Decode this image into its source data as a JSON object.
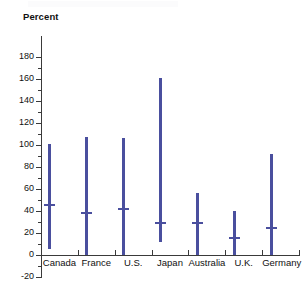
{
  "chart_data": {
    "type": "bar",
    "subtype": "range-with-median",
    "title": "",
    "xlabel": "",
    "ylabel": "Percent",
    "ylim": [
      -20,
      180
    ],
    "y_major_step": 20,
    "y_minor_step": 10,
    "grid": false,
    "legend": "none",
    "y_tick_labels": [
      "180",
      "160",
      "140",
      "120",
      "100",
      "80",
      "60",
      "40",
      "20",
      "0",
      "-20"
    ],
    "y_tick_values": [
      180,
      160,
      140,
      120,
      100,
      80,
      60,
      40,
      20,
      0,
      -20
    ],
    "categories": [
      "Canada",
      "France",
      "U.S.",
      "Japan",
      "Australia",
      "U.K.",
      "Germany"
    ],
    "series": [
      {
        "name": "Range",
        "low": [
          5,
          0,
          0,
          12,
          0,
          0,
          0
        ],
        "high": [
          101,
          107,
          106,
          161,
          56,
          40,
          92
        ],
        "median": [
          46,
          39,
          43,
          30,
          30,
          16,
          25
        ]
      }
    ],
    "bar_color": "#4a4f9e",
    "axis_color": "#3a3a3a",
    "background_color": "#ffffff"
  }
}
